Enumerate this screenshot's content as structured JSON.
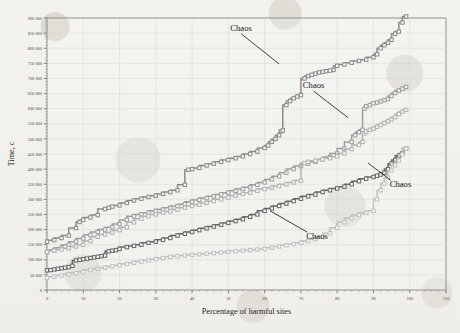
{
  "chart_data": {
    "type": "line",
    "title": "",
    "xlabel": "Percentage of harmful sites",
    "ylabel": "Time, c",
    "xlim": [
      0,
      110
    ],
    "ylim": [
      0,
      900000
    ],
    "grid": true,
    "legend_position": "none",
    "xticks": [
      0,
      10,
      20,
      30,
      40,
      50,
      60,
      70,
      80,
      90,
      100,
      110
    ],
    "xticklabels": [
      "0",
      "10",
      "20",
      "30",
      "40",
      "50",
      "60",
      "70",
      "80",
      "90",
      "100",
      "110"
    ],
    "yticks": [
      0,
      50000,
      100000,
      150000,
      200000,
      250000,
      300000,
      350000,
      400000,
      450000,
      500000,
      550000,
      600000,
      650000,
      700000,
      750000,
      800000,
      850000,
      900000
    ],
    "yticklabels": [
      "0",
      "50 000",
      "100 000",
      "150 000",
      "200 000",
      "250 000",
      "300 000",
      "350 000",
      "400 000",
      "450 000",
      "500 000",
      "550 000",
      "600 000",
      "650 000",
      "700 000",
      "750 000",
      "800 000",
      "850 000",
      "900 000"
    ],
    "marker": "square",
    "annotations": [
      {
        "label": "Chaos",
        "text_x": 53.5,
        "text_y": 858000,
        "point_x": 64.0,
        "point_y": 748000
      },
      {
        "label": "Chaos",
        "text_x": 73.5,
        "text_y": 668000,
        "point_x": 83.0,
        "point_y": 570000
      },
      {
        "label": "Chaos",
        "text_x": 94.5,
        "text_y": 340000,
        "point_x": 88.5,
        "point_y": 420000
      },
      {
        "label": "Chaos",
        "text_x": 71.5,
        "text_y": 168000,
        "point_x": 61.5,
        "point_y": 262000
      }
    ],
    "series": [
      {
        "name": "series-1",
        "color": "#8a8a8a",
        "x": [
          0,
          2,
          4,
          6,
          8,
          9,
          10,
          12,
          14,
          16,
          17,
          18,
          20,
          22,
          24,
          26,
          28,
          30,
          32,
          34,
          36,
          38,
          39,
          40,
          42,
          44,
          46,
          48,
          50,
          52,
          54,
          56,
          58,
          60,
          61,
          62,
          63,
          64,
          64.5,
          65,
          66,
          67,
          68,
          69,
          70,
          71,
          72,
          73,
          74,
          75,
          76,
          77,
          78,
          79,
          80,
          82,
          84,
          86,
          88,
          90,
          91,
          92,
          93,
          94,
          95,
          96,
          97,
          98,
          99
        ],
        "y": [
          160000,
          165000,
          172000,
          180000,
          205000,
          225000,
          232000,
          240000,
          248000,
          268000,
          272000,
          276000,
          280000,
          288000,
          296000,
          302000,
          308000,
          312000,
          318000,
          324000,
          330000,
          348000,
          398000,
          400000,
          404000,
          412000,
          418000,
          424000,
          430000,
          436000,
          442000,
          450000,
          458000,
          470000,
          478000,
          490000,
          500000,
          512000,
          525000,
          528000,
          612000,
          625000,
          634000,
          640000,
          645000,
          700000,
          708000,
          712000,
          716000,
          720000,
          722000,
          724000,
          726000,
          728000,
          742000,
          746000,
          752000,
          758000,
          762000,
          770000,
          780000,
          800000,
          810000,
          818000,
          828000,
          848000,
          855000,
          885000,
          905000
        ]
      },
      {
        "name": "series-2",
        "color": "#9d9d9d",
        "x": [
          0,
          2,
          4,
          6,
          8,
          10,
          12,
          14,
          16,
          18,
          20,
          22,
          24,
          26,
          28,
          30,
          32,
          34,
          36,
          38,
          40,
          42,
          44,
          46,
          48,
          50,
          52,
          54,
          56,
          58,
          60,
          62,
          64,
          66,
          68,
          70,
          72,
          74,
          76,
          78,
          80,
          82,
          84,
          85,
          86,
          87,
          87.5,
          88,
          89,
          90,
          91,
          92,
          93,
          94,
          95,
          96,
          97,
          98,
          99
        ],
        "y": [
          125000,
          132000,
          140000,
          150000,
          160000,
          170000,
          182000,
          192000,
          200000,
          208000,
          218000,
          232000,
          244000,
          250000,
          256000,
          262000,
          266000,
          272000,
          278000,
          284000,
          292000,
          298000,
          304000,
          310000,
          316000,
          322000,
          328000,
          334000,
          340000,
          348000,
          356000,
          366000,
          376000,
          388000,
          400000,
          410000,
          418000,
          424000,
          432000,
          440000,
          452000,
          468000,
          490000,
          512000,
          522000,
          530000,
          600000,
          608000,
          612000,
          618000,
          620000,
          624000,
          628000,
          632000,
          642000,
          652000,
          660000,
          666000,
          672000
        ]
      },
      {
        "name": "series-3",
        "color": "#b2b2b2",
        "x": [
          0,
          2,
          4,
          6,
          8,
          10,
          12,
          14,
          16,
          18,
          20,
          22,
          24,
          26,
          28,
          30,
          32,
          34,
          36,
          38,
          40,
          42,
          44,
          46,
          48,
          50,
          52,
          54,
          56,
          58,
          60,
          62,
          64,
          66,
          68,
          70,
          71,
          72,
          74,
          76,
          78,
          80,
          82,
          84,
          86,
          87,
          87.5,
          88,
          89,
          90,
          91,
          92,
          93,
          94,
          95,
          96,
          97,
          98,
          99
        ],
        "y": [
          126000,
          130000,
          134000,
          138000,
          144000,
          150000,
          162000,
          176000,
          184000,
          190000,
          198000,
          208000,
          224000,
          236000,
          244000,
          250000,
          256000,
          260000,
          266000,
          272000,
          278000,
          282000,
          288000,
          294000,
          300000,
          306000,
          312000,
          318000,
          322000,
          328000,
          334000,
          338000,
          344000,
          350000,
          356000,
          362000,
          420000,
          424000,
          428000,
          432000,
          436000,
          442000,
          452000,
          466000,
          480000,
          490000,
          518000,
          524000,
          530000,
          534000,
          540000,
          546000,
          552000,
          558000,
          564000,
          572000,
          582000,
          590000,
          596000
        ]
      },
      {
        "name": "series-4",
        "color": "#666666",
        "x": [
          0,
          1,
          2,
          3,
          4,
          5,
          6,
          7,
          8,
          9,
          10,
          11,
          12,
          13,
          14,
          15,
          16,
          17,
          18,
          19,
          20,
          22,
          24,
          26,
          28,
          30,
          32,
          34,
          36,
          38,
          40,
          42,
          44,
          46,
          48,
          50,
          52,
          54,
          56,
          58,
          60,
          62,
          64,
          66,
          68,
          70,
          72,
          74,
          76,
          78,
          80,
          82,
          84,
          86,
          88,
          90,
          91,
          92,
          93,
          94,
          95,
          96,
          97,
          98,
          99
        ],
        "y": [
          65000,
          66000,
          68000,
          70000,
          72000,
          74000,
          76000,
          80000,
          98000,
          100000,
          102000,
          104000,
          106000,
          108000,
          110000,
          112000,
          114000,
          128000,
          130000,
          132000,
          136000,
          142000,
          146000,
          150000,
          156000,
          160000,
          166000,
          172000,
          180000,
          186000,
          192000,
          198000,
          204000,
          210000,
          216000,
          222000,
          228000,
          234000,
          242000,
          250000,
          262000,
          270000,
          278000,
          286000,
          294000,
          302000,
          310000,
          316000,
          324000,
          330000,
          336000,
          342000,
          350000,
          360000,
          368000,
          374000,
          378000,
          382000,
          388000,
          400000,
          418000,
          430000,
          444000,
          452000,
          468000
        ]
      },
      {
        "name": "series-5",
        "color": "#c0c0c0",
        "x": [
          0,
          2,
          4,
          6,
          8,
          10,
          12,
          14,
          16,
          18,
          20,
          22,
          24,
          26,
          28,
          30,
          32,
          34,
          36,
          38,
          40,
          42,
          44,
          46,
          48,
          50,
          52,
          54,
          56,
          58,
          60,
          62,
          64,
          66,
          68,
          70,
          72,
          74,
          76,
          78,
          80,
          82,
          84,
          86,
          88,
          90,
          91,
          92,
          93,
          94,
          95,
          96,
          97,
          98,
          99
        ],
        "y": [
          40000,
          44000,
          48000,
          52000,
          56000,
          60000,
          66000,
          70000,
          74000,
          78000,
          82000,
          86000,
          90000,
          94000,
          98000,
          102000,
          106000,
          110000,
          112000,
          114000,
          116000,
          118000,
          120000,
          122000,
          124000,
          126000,
          128000,
          130000,
          132000,
          134000,
          136000,
          140000,
          144000,
          148000,
          152000,
          156000,
          162000,
          168000,
          176000,
          188000,
          206000,
          224000,
          238000,
          248000,
          256000,
          262000,
          300000,
          330000,
          352000,
          372000,
          396000,
          412000,
          428000,
          448000,
          468000
        ]
      }
    ]
  }
}
